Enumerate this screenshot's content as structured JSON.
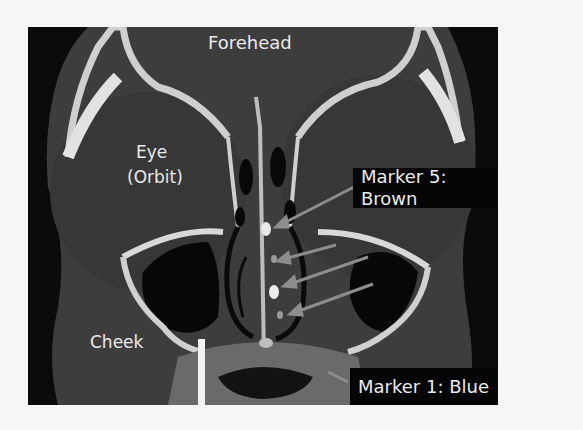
{
  "figure": {
    "type": "coronal CT scan of sinuses with annotated markers",
    "labels": {
      "forehead": "Forehead",
      "eye_line1": "Eye",
      "eye_line2": "(Orbit)",
      "cheek": "Cheek"
    },
    "markers": {
      "top_callout": "Marker 5: Brown",
      "bottom_callout": "Marker 1: Blue",
      "count": 5
    },
    "colors": {
      "page_bg": "#f6f6f6",
      "frame_bg": "#0b0b0b",
      "soft_tissue": "#3f3f3f",
      "bone": "#d9d9d9",
      "air": "#0a0a0a",
      "text": "#ececec",
      "arrow": "#8a8a8a"
    }
  }
}
